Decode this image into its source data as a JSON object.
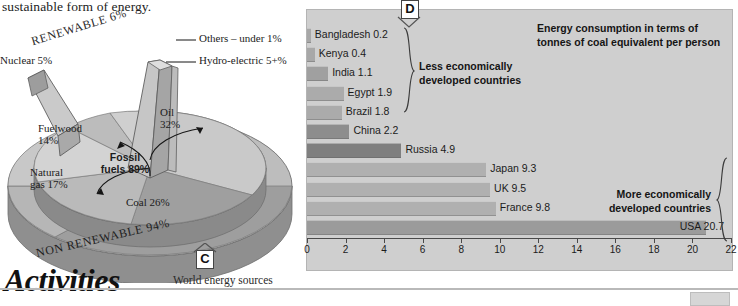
{
  "page": {
    "body_text": "sustainable form of energy.",
    "activities_heading": "Activities"
  },
  "pie_figure": {
    "tag": "C",
    "caption": "World energy sources",
    "outer_ring_labels": {
      "renewable": "RENEWABLE 6%",
      "non_renewable": "NON RENEWABLE 94%"
    },
    "center_label": "Fossil\nfuels 89%",
    "center_label_line1": "Fossil",
    "center_label_line2": "fuels 89%",
    "callouts": [
      {
        "label": "Others – under 1%"
      },
      {
        "label": "Hydro-electric 5+%"
      }
    ],
    "slices": [
      {
        "label": "Nuclear 5%",
        "name": "Nuclear",
        "value": 5
      },
      {
        "label": "Fuelwood\n14%",
        "line1": "Fuelwood",
        "line2": "14%",
        "name": "Fuelwood",
        "value": 14
      },
      {
        "label": "Natural\ngas 17%",
        "line1": "Natural",
        "line2": "gas 17%",
        "name": "Natural gas",
        "value": 17
      },
      {
        "label": "Coal 26%",
        "name": "Coal",
        "value": 26
      },
      {
        "label": "Oil\n32%",
        "line1": "Oil",
        "line2": "32%",
        "name": "Oil",
        "value": 32
      },
      {
        "label": "Hydro-electric 5+%",
        "name": "Hydro-electric",
        "value": 5
      },
      {
        "label": "Others – under 1%",
        "name": "Others",
        "value": 1
      }
    ]
  },
  "bar_figure": {
    "tag": "D",
    "group_less": "Less economically\ndeveloped countries",
    "group_less_l1": "Less economically",
    "group_less_l2": "developed countries",
    "group_more": "More economically\ndeveloped countries",
    "group_more_l1": "More economically",
    "group_more_l2": "developed countries",
    "title_l1": "Energy consumption in terms of tonnes",
    "title_l2": "of coal equivalent per person"
  },
  "chart_data": {
    "type": "bar",
    "orientation": "horizontal",
    "title": "Energy consumption in terms of tonnes of coal equivalent per person",
    "xlabel": "",
    "ylabel": "",
    "xlim": [
      0,
      22
    ],
    "xticks": [
      0,
      2,
      4,
      6,
      8,
      10,
      12,
      14,
      16,
      18,
      20,
      22
    ],
    "grid": false,
    "legend": false,
    "categories": [
      "Bangladesh",
      "Kenya",
      "India",
      "Egypt",
      "Brazil",
      "China",
      "Russia",
      "Japan",
      "UK",
      "France",
      "USA"
    ],
    "values": [
      0.2,
      0.4,
      1.1,
      1.9,
      1.8,
      2.2,
      4.9,
      9.3,
      9.5,
      9.8,
      20.7
    ],
    "data_labels": [
      "Bangladesh 0.2",
      "Kenya 0.4",
      "India 1.1",
      "Egypt 1.9",
      "Brazil 1.8",
      "China 2.2",
      "Russia 4.9",
      "Japan 9.3",
      "UK 9.5",
      "France 9.8",
      "USA 20.7"
    ],
    "bar_colors": [
      "#a8a8a8",
      "#a8a8a8",
      "#a0a0a0",
      "#ababab",
      "#ababab",
      "#8d8d8d",
      "#7f7f7f",
      "#b0b0b0",
      "#b0b0b0",
      "#b0b0b0",
      "#9b9b9b"
    ],
    "groups": [
      {
        "name": "Less economically developed countries",
        "members": [
          "Bangladesh",
          "Kenya",
          "India",
          "Egypt",
          "Brazil",
          "China"
        ]
      },
      {
        "name": "More economically developed countries",
        "members": [
          "Japan",
          "UK",
          "France",
          "USA"
        ]
      }
    ]
  },
  "pie_chart_data": {
    "type": "pie",
    "title": "World energy sources",
    "labels": [
      "Oil",
      "Coal",
      "Natural gas",
      "Fuelwood",
      "Nuclear",
      "Hydro-electric",
      "Others"
    ],
    "values": [
      32,
      26,
      17,
      14,
      5,
      5,
      1
    ],
    "annotations": [
      "Fossil fuels 89%",
      "RENEWABLE 6%",
      "NON RENEWABLE 94%"
    ]
  },
  "colors": {
    "panel_bg": "#cfcfcf",
    "axis": "#4a4a4a",
    "text": "#1b1b1b"
  }
}
